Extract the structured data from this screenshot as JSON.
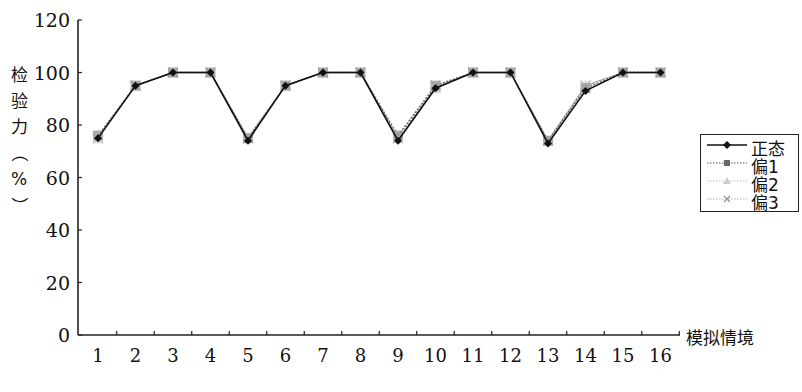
{
  "chart_data": {
    "type": "line",
    "title": "",
    "xlabel": "模拟情境",
    "ylabel": "检验力（%）",
    "ylim": [
      0,
      120
    ],
    "yticks": [
      0,
      20,
      40,
      60,
      80,
      100,
      120
    ],
    "grid": false,
    "legend_position": "right",
    "categories": [
      "1",
      "2",
      "3",
      "4",
      "5",
      "6",
      "7",
      "8",
      "9",
      "10",
      "11",
      "12",
      "13",
      "14",
      "15",
      "16"
    ],
    "series": [
      {
        "name": "正态",
        "marker": "diamond",
        "color": "#111111",
        "dash": "solid",
        "values": [
          75,
          95,
          100,
          100,
          74,
          95,
          100,
          100,
          74,
          94,
          100,
          100,
          73,
          93,
          100,
          100
        ]
      },
      {
        "name": "偏1",
        "marker": "square",
        "color": "#666666",
        "dash": "dotted",
        "values": [
          76,
          95,
          100,
          100,
          75,
          95,
          100,
          100,
          76,
          95,
          100,
          100,
          74,
          94,
          100,
          100
        ]
      },
      {
        "name": "偏2",
        "marker": "triangle",
        "color": "#aaaaaa",
        "dash": "dotted",
        "values": [
          75,
          95,
          100,
          100,
          75,
          95,
          100,
          100,
          75,
          94,
          100,
          100,
          74,
          95,
          100,
          100
        ]
      },
      {
        "name": "偏3",
        "marker": "x",
        "color": "#999999",
        "dash": "dotted",
        "values": [
          75,
          95,
          100,
          100,
          75,
          95,
          100,
          100,
          75,
          95,
          100,
          100,
          74,
          95,
          100,
          100
        ]
      }
    ]
  },
  "axis": {
    "y_title_chars": [
      "检",
      "验",
      "力",
      "（",
      "%",
      "）"
    ],
    "x_title": "模拟情境"
  },
  "legend": {
    "items": [
      "正态",
      "偏1",
      "偏2",
      "偏3"
    ]
  }
}
